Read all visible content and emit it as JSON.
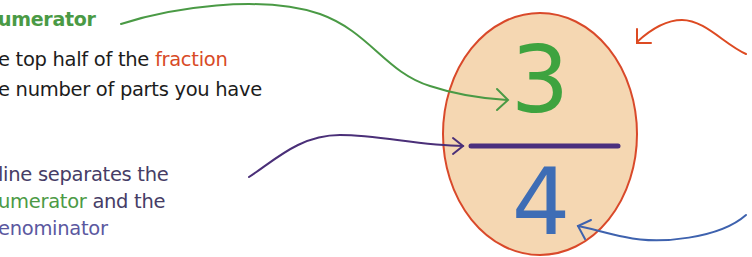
{
  "annotation_top": {
    "title": "umerator",
    "line1_prefix": "e top half of the ",
    "line1_highlight": "fraction",
    "line2": "e number of parts you have"
  },
  "annotation_middle": {
    "line1": "line separates the",
    "line2_highlight": "umerator",
    "line2_suffix": " and the",
    "line3": "enominator"
  },
  "fraction": {
    "numerator": "3",
    "denominator": "4"
  },
  "colors": {
    "numerator": "#3ea33f",
    "denominator": "#3e6db5",
    "fraction_bar": "#4b2f7e",
    "ellipse_fill": "#f5d7b2",
    "ellipse_stroke": "#d9492a",
    "fraction_word": "#d84a26",
    "text": "#1c1c1c",
    "bar_text": "#463d66"
  }
}
